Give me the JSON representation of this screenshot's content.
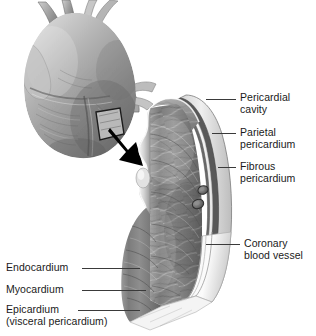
{
  "figure": {
    "background_color": "#ffffff",
    "ink_color": "#1a1a1a",
    "style": "grayscale anatomical illustration"
  },
  "inset": {
    "name": "whole heart",
    "description": "Anterior view of the heart with great vessels, showing the window region removed"
  },
  "arrow": {
    "name": "magnification arrow",
    "direction": "down-right",
    "color": "#000000"
  },
  "block": {
    "name": "heart wall block section",
    "description": "Three dimensional cut-away block of the heart wall showing endocardium, myocardium, epicardium, pericardial cavity, parietal and fibrous pericardium"
  },
  "labels": {
    "right": [
      {
        "id": "pericardial-cavity",
        "lines": [
          "Pericardial",
          "cavity"
        ]
      },
      {
        "id": "parietal-pericardium",
        "lines": [
          "Parietal",
          "pericardium"
        ]
      },
      {
        "id": "fibrous-pericardium",
        "lines": [
          "Fibrous",
          "pericardium"
        ]
      },
      {
        "id": "coronary-blood-vessel",
        "lines": [
          "Coronary",
          "blood vessel"
        ]
      }
    ],
    "left": [
      {
        "id": "endocardium",
        "lines": [
          "Endocardium"
        ]
      },
      {
        "id": "myocardium",
        "lines": [
          "Myocardium"
        ]
      },
      {
        "id": "epicardium",
        "lines": [
          "Epicardium",
          "(visceral pericardium)"
        ]
      }
    ]
  },
  "colors": {
    "leader_line": "#3a3a3a",
    "myocardium_dark": "#6f6f6f",
    "myocardium_mid": "#8d8d8d",
    "myocardium_light": "#b4b4b4",
    "pericardium_band": "#545454",
    "cavity_light": "#f2f2f2",
    "outline": "#4a4a4a"
  }
}
